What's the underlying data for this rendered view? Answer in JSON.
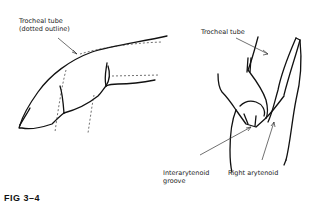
{
  "figure": {
    "caption": "FIG 3–4",
    "left_panel": {
      "label_line1": "Trocheal tube",
      "label_line2": "(dotted outline)"
    },
    "right_panel": {
      "label_tube": "Trocheal tube",
      "label_groove_line1": "Interarytenoid",
      "label_groove_line2": "groove",
      "label_arytenoid": "Right arytenoid"
    }
  }
}
